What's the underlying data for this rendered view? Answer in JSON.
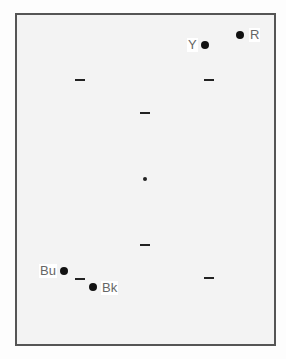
{
  "diagram": {
    "labels": {
      "yellow": "Y",
      "red": "R",
      "blue": "Bu",
      "black": "Bk"
    },
    "points": [
      {
        "id": "Y",
        "label": "Y",
        "x": 205,
        "y": 45,
        "label_side": "left"
      },
      {
        "id": "R",
        "label": "R",
        "x": 240,
        "y": 35,
        "label_side": "right"
      },
      {
        "id": "Bu",
        "label": "Bu",
        "x": 64,
        "y": 271,
        "label_side": "left"
      },
      {
        "id": "Bk",
        "label": "Bk",
        "x": 93,
        "y": 287,
        "label_side": "right"
      }
    ],
    "dashes": [
      {
        "x": 80,
        "y": 80
      },
      {
        "x": 209,
        "y": 80
      },
      {
        "x": 145,
        "y": 113
      },
      {
        "x": 145,
        "y": 245
      },
      {
        "x": 80,
        "y": 279
      },
      {
        "x": 209,
        "y": 278
      }
    ],
    "center": {
      "x": 145,
      "y": 179
    }
  }
}
